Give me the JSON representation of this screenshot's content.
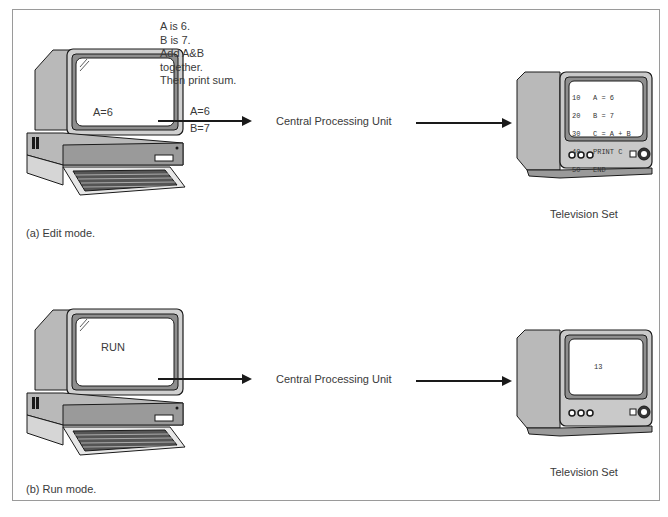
{
  "panels": [
    {
      "id": "edit",
      "caption": "(a) Edit mode.",
      "computer_screen_text": "A=6",
      "instructions": [
        "A is 6.",
        "B is 7.",
        "Add A&B",
        "together.",
        "Then print sum."
      ],
      "arrow_label_top": "A=6",
      "arrow_label_bottom": "B=7",
      "cpu_label": "Central Processing Unit",
      "tv_label": "Television Set",
      "tv_screen_lines": [
        {
          "num": "10",
          "code": "A = 6"
        },
        {
          "num": "20",
          "code": "B = 7"
        },
        {
          "num": "30",
          "code": "C = A + B"
        },
        {
          "num": "40",
          "code": "PRINT C"
        },
        {
          "num": "50",
          "code": "END"
        }
      ]
    },
    {
      "id": "run",
      "caption": "(b) Run mode.",
      "computer_screen_text": "RUN",
      "cpu_label": "Central Processing Unit",
      "tv_label": "Television Set",
      "tv_screen_text": "13"
    }
  ],
  "colors": {
    "body_gray": "#b9b9b9",
    "dark_gray": "#8e8e8e",
    "line": "#1a1a1a",
    "frame": "#9a9a9a"
  }
}
